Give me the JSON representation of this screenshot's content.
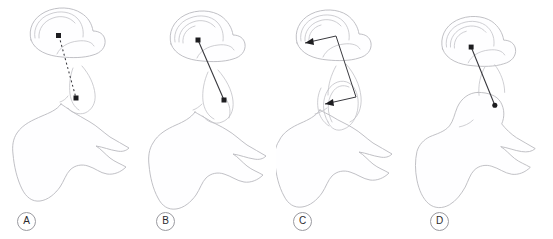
{
  "figure": {
    "caption_present": false,
    "background_color": "#ffffff",
    "outline_color": "#b9b9be",
    "annotation_color": "#1d1d20",
    "label_border_color": "#9a9aa0",
    "width": 553,
    "height": 239
  },
  "panels": [
    {
      "id": "panel-a",
      "label": "A",
      "label_x": 25,
      "label_y": 212,
      "offset_x": 0,
      "annotation_type": "dashed-line",
      "annotation_name": "dashed-measurement-line",
      "markers": "square",
      "line": {
        "x1": 59,
        "y1": 36,
        "x2": 76,
        "y2": 98
      }
    },
    {
      "id": "panel-b",
      "label": "B",
      "label_x": 164,
      "label_y": 212,
      "offset_x": 138,
      "annotation_type": "solid-line",
      "annotation_name": "solid-measurement-line",
      "markers": "square",
      "line": {
        "x1": 60,
        "y1": 40,
        "x2": 86,
        "y2": 100
      }
    },
    {
      "id": "panel-c",
      "label": "C",
      "label_x": 301,
      "label_y": 212,
      "offset_x": 276,
      "annotation_type": "bracket-double-arrow",
      "annotation_name": "bracket-span-indicator",
      "markers": "arrowhead",
      "bracket": {
        "x1": 29,
        "y1": 43,
        "x2": 60,
        "y2": 36,
        "x3": 80,
        "y3": 97,
        "x4": 49,
        "y4": 104
      }
    },
    {
      "id": "panel-d",
      "label": "D",
      "label_x": 438,
      "label_y": 212,
      "offset_x": 413,
      "annotation_type": "solid-line",
      "annotation_name": "solid-measurement-line",
      "markers": "dot",
      "line": {
        "x1": 59,
        "y1": 46,
        "x2": 83,
        "y2": 105
      }
    }
  ]
}
